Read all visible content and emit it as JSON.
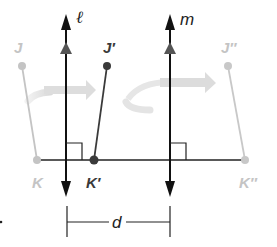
{
  "figure": {
    "labels": {
      "line_l": "ℓ",
      "line_m": "m",
      "J": "J",
      "K": "K",
      "J_prime": "J′",
      "K_prime": "K′",
      "J_double_prime": "J″",
      "K_double_prime": "K″",
      "distance": "d"
    },
    "colors": {
      "preimage": "#c4c4c4",
      "first_image": "#3a3a3a",
      "second_image": "#c8c8c8",
      "lines": "#111111",
      "rotation_arrow": "#e2e2e2"
    }
  }
}
